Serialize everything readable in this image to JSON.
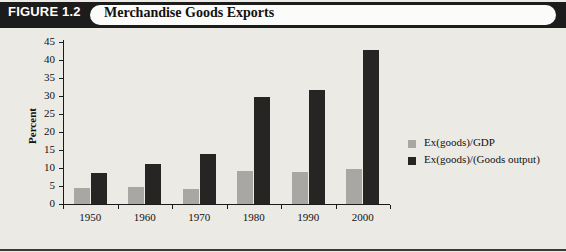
{
  "figure": {
    "number_label": "FIGURE 1.2",
    "title": "Merchandise Goods Exports"
  },
  "chart_data": {
    "type": "bar",
    "title": "Merchandise Goods Exports",
    "xlabel": "",
    "ylabel": "Percent",
    "ylim": [
      0,
      45
    ],
    "yticks": [
      "0",
      "5",
      "10",
      "15",
      "20",
      "25",
      "30",
      "35",
      "40",
      "45"
    ],
    "grid": false,
    "legend_position": "right",
    "categories": [
      "1950",
      "1960",
      "1970",
      "1980",
      "1990",
      "2000"
    ],
    "series": [
      {
        "name": "Ex(goods)/GDP",
        "color": "#a9a7a3",
        "values": [
          4.5,
          4.8,
          4.2,
          9.3,
          8.9,
          9.7
        ]
      },
      {
        "name": "Ex(goods)/(Goods output)",
        "color": "#262524",
        "values": [
          8.7,
          11.0,
          14.0,
          29.7,
          31.7,
          42.7
        ]
      }
    ]
  }
}
